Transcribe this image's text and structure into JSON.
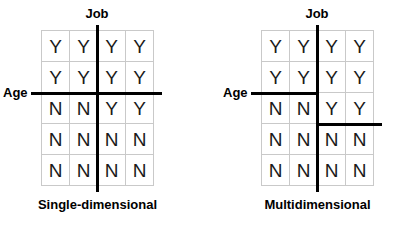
{
  "figure": {
    "width": 400,
    "height": 228,
    "background": "#ffffff",
    "line_color": "#000000",
    "cell_border_color": "#c9c9c9",
    "text_color": "#1a1a1a"
  },
  "panels": [
    {
      "id": "single-dimensional",
      "caption": "Single-dimensional",
      "top_axis_label": "Job",
      "left_axis_label": "Age",
      "columns": 4,
      "rows": 5,
      "cells": [
        [
          "Y",
          "Y",
          "Y",
          "Y"
        ],
        [
          "Y",
          "Y",
          "Y",
          "Y"
        ],
        [
          "N",
          "N",
          "Y",
          "Y"
        ],
        [
          "N",
          "N",
          "N",
          "N"
        ],
        [
          "N",
          "N",
          "N",
          "N"
        ]
      ],
      "splits": [
        {
          "name": "job-split-vertical",
          "orientation": "vertical",
          "after_column": 2,
          "spans_full": true
        },
        {
          "name": "age-split-horizontal",
          "orientation": "horizontal",
          "after_row": 2,
          "spans_full": true
        }
      ]
    },
    {
      "id": "multidimensional",
      "caption": "Multidimensional",
      "top_axis_label": "Job",
      "left_axis_label": "Age",
      "columns": 4,
      "rows": 5,
      "cells": [
        [
          "Y",
          "Y",
          "Y",
          "Y"
        ],
        [
          "Y",
          "Y",
          "Y",
          "Y"
        ],
        [
          "N",
          "N",
          "Y",
          "Y"
        ],
        [
          "N",
          "N",
          "N",
          "N"
        ],
        [
          "N",
          "N",
          "N",
          "N"
        ]
      ],
      "splits": [
        {
          "name": "job-split-vertical",
          "orientation": "vertical",
          "after_column": 2,
          "spans_full": true
        },
        {
          "name": "age-split-horizontal-left",
          "orientation": "horizontal",
          "after_row": 2,
          "from_column": 0,
          "to_column": 2
        },
        {
          "name": "age-split-horizontal-right",
          "orientation": "horizontal",
          "after_row": 3,
          "from_column": 2,
          "to_column": 4
        }
      ]
    }
  ]
}
